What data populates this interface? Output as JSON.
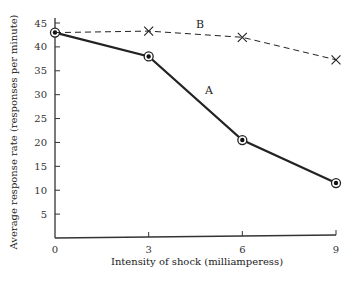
{
  "chart_data": {
    "type": "line",
    "title": "",
    "xlabel": "Intensity of shock (milliamperess)",
    "ylabel": "Average response rate  (responses per minute)",
    "x": [
      0,
      3,
      6,
      9
    ],
    "x_ticks": [
      "0",
      "3",
      "6",
      "9"
    ],
    "y_ticks": [
      "5",
      "10",
      "15",
      "20",
      "25",
      "30",
      "35",
      "40",
      "45"
    ],
    "xlim": [
      0,
      9
    ],
    "ylim": [
      0,
      45
    ],
    "grid": false,
    "legend": "inline labels",
    "series": [
      {
        "name": "A",
        "style": "solid",
        "marker": "circled-dot",
        "values": [
          43,
          38,
          20.5,
          11.5
        ]
      },
      {
        "name": "B",
        "style": "dashed",
        "marker": "x",
        "values": [
          43,
          43.3,
          42,
          37.3
        ]
      }
    ]
  }
}
